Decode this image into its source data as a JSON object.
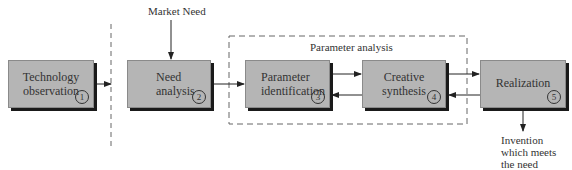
{
  "diagram": {
    "market_input": "Market Need",
    "group_label": "Parameter analysis",
    "output_lines": [
      "Invention",
      "which meets",
      "the need"
    ],
    "steps": [
      {
        "lines": [
          "Technology",
          "observation"
        ],
        "number": "1"
      },
      {
        "lines": [
          "Need",
          "analysis"
        ],
        "number": "2"
      },
      {
        "lines": [
          "Parameter",
          "identification"
        ],
        "number": "3"
      },
      {
        "lines": [
          "Creative",
          "synthesis"
        ],
        "number": "4"
      },
      {
        "lines": [
          "Realization"
        ],
        "number": "5"
      }
    ]
  }
}
